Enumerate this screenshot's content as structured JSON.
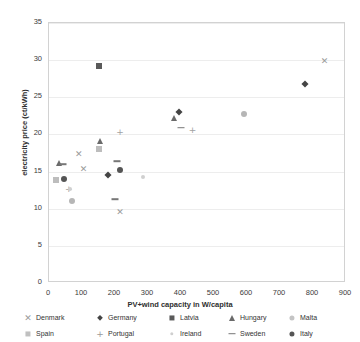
{
  "chart_data": {
    "type": "scatter",
    "title": "",
    "xlabel": "PV+wind capacity in W/capita",
    "ylabel": "electricity price (ct/kWh)",
    "xlim": [
      0,
      900
    ],
    "ylim": [
      0,
      35
    ],
    "xticks": [
      "0",
      "100",
      "200",
      "300",
      "400",
      "500",
      "600",
      "700",
      "800",
      "900"
    ],
    "yticks": [
      "0",
      "5",
      "10",
      "15",
      "20",
      "25",
      "30",
      "35"
    ],
    "grid": "horizontal",
    "legend_position": "bottom",
    "series": [
      {
        "name": "Denmark",
        "marker": "cross-x",
        "color": "#9a9a9a",
        "points": [
          {
            "x": 835,
            "y": 29.9
          },
          {
            "x": 90,
            "y": 17.4
          },
          {
            "x": 105,
            "y": 15.4
          },
          {
            "x": 215,
            "y": 9.6
          }
        ]
      },
      {
        "name": "Germany",
        "marker": "diamond",
        "color": "#444444",
        "points": [
          {
            "x": 775,
            "y": 26.8
          },
          {
            "x": 395,
            "y": 23.0
          },
          {
            "x": 180,
            "y": 14.6
          }
        ]
      },
      {
        "name": "Latvia",
        "marker": "square",
        "color": "#5a5a5a",
        "points": [
          {
            "x": 150,
            "y": 29.2
          },
          {
            "x": 152,
            "y": 18.0
          }
        ]
      },
      {
        "name": "Hungary",
        "marker": "triangle",
        "color": "#6a6a6a",
        "points": [
          {
            "x": 380,
            "y": 22.2
          },
          {
            "x": 155,
            "y": 19.1
          },
          {
            "x": 30,
            "y": 16.2
          }
        ]
      },
      {
        "name": "Malta",
        "marker": "circle",
        "color": "#b6b6b6",
        "points": [
          {
            "x": 590,
            "y": 22.7
          },
          {
            "x": 70,
            "y": 11.0
          }
        ]
      },
      {
        "name": "Spain",
        "marker": "square",
        "color": "#bdbdbd",
        "points": [
          {
            "x": 152,
            "y": 18.0
          },
          {
            "x": 22,
            "y": 13.8
          }
        ]
      },
      {
        "name": "Portugal",
        "marker": "plus",
        "color": "#a2a2a2",
        "points": [
          {
            "x": 435,
            "y": 20.6
          },
          {
            "x": 215,
            "y": 20.3
          },
          {
            "x": 60,
            "y": 12.6
          }
        ]
      },
      {
        "name": "Ireland",
        "marker": "dot-small",
        "color": "#d0d0d0",
        "points": [
          {
            "x": 285,
            "y": 14.3
          },
          {
            "x": 65,
            "y": 12.6
          }
        ]
      },
      {
        "name": "Sweden",
        "marker": "dash",
        "color": "#777777",
        "points": [
          {
            "x": 400,
            "y": 20.9
          },
          {
            "x": 42,
            "y": 16.0
          },
          {
            "x": 205,
            "y": 16.4
          },
          {
            "x": 200,
            "y": 11.3
          }
        ]
      },
      {
        "name": "Italy",
        "marker": "circle",
        "color": "#555555",
        "points": [
          {
            "x": 215,
            "y": 15.2
          },
          {
            "x": 45,
            "y": 14.0
          }
        ]
      }
    ]
  },
  "legend": {
    "rows": [
      [
        {
          "label": "Denmark",
          "marker": "cross-x",
          "color": "#9a9a9a"
        },
        {
          "label": "Germany",
          "marker": "diamond",
          "color": "#444444"
        },
        {
          "label": "Latvia",
          "marker": "square",
          "color": "#5a5a5a"
        },
        {
          "label": "Hungary",
          "marker": "triangle",
          "color": "#6a6a6a"
        },
        {
          "label": "Malta",
          "marker": "circle",
          "color": "#c4c4c4"
        }
      ],
      [
        {
          "label": "Spain",
          "marker": "square",
          "color": "#c0c0c0"
        },
        {
          "label": "Portugal",
          "marker": "plus",
          "color": "#9a9a9a"
        },
        {
          "label": "Ireland",
          "marker": "dot-small",
          "color": "#cfcfcf"
        },
        {
          "label": "Sweden",
          "marker": "dash",
          "color": "#777777"
        },
        {
          "label": "Italy",
          "marker": "circle",
          "color": "#555555"
        }
      ]
    ]
  }
}
